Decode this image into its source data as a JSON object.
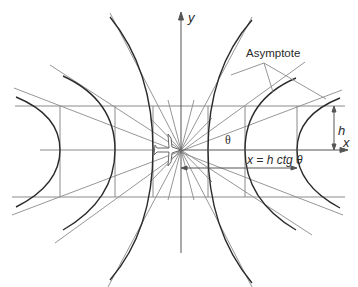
{
  "diagram": {
    "type": "geometric construction",
    "origin": [
      181,
      150
    ],
    "axes": {
      "x_label": "x",
      "y_label": "y"
    },
    "labels": {
      "asymptote": "Asymptote",
      "theta": "θ",
      "height": "h",
      "formula": "x = h ctg θ"
    },
    "reference_lines": {
      "upper_y": 106,
      "lower_y": 197,
      "left_x": [
        60,
        115,
        153
      ],
      "right_x": [
        208,
        245,
        297
      ]
    },
    "hyperbolas": {
      "right": [
        {
          "a": 27,
          "b": 51
        },
        {
          "a": 64,
          "b": 45
        },
        {
          "a": 116,
          "b": 42
        }
      ],
      "left": [
        {
          "a": 28,
          "b": 52
        },
        {
          "a": 66,
          "b": 46
        },
        {
          "a": 121,
          "b": 43
        }
      ]
    },
    "colors": {
      "curve": "#2b2b2b",
      "line": "#7a7a7a",
      "axis": "#555555"
    }
  }
}
